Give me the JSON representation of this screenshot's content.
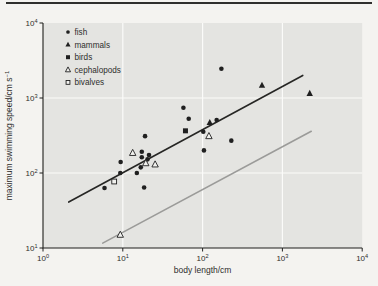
{
  "chart_data": {
    "type": "scatter",
    "title": "",
    "xlabel": "body length/cm",
    "ylabel": "maximum swimming speed/cm s",
    "ylabel_sup": "−1",
    "x_scale": "log",
    "y_scale": "log",
    "xlim": [
      1,
      10000
    ],
    "ylim": [
      10,
      10000
    ],
    "x_tick_exponents": [
      0,
      1,
      2,
      3,
      4
    ],
    "y_tick_exponents": [
      1,
      2,
      3,
      4
    ],
    "tick_base": "10",
    "grid": true,
    "legend_position": "top-left",
    "series": [
      {
        "name": "fish",
        "marker": "filled-circle",
        "points": [
          [
            5.9,
            63
          ],
          [
            9.4,
            140
          ],
          [
            9.3,
            100
          ],
          [
            15,
            100
          ],
          [
            16.8,
            119
          ],
          [
            18.5,
            64
          ],
          [
            17.3,
            192
          ],
          [
            17.3,
            162
          ],
          [
            19,
            310
          ],
          [
            20.4,
            152
          ],
          [
            21.3,
            174
          ],
          [
            57.5,
            740
          ],
          [
            67,
            530
          ],
          [
            102,
            355
          ],
          [
            104,
            200
          ],
          [
            150,
            510
          ],
          [
            172,
            2450
          ],
          [
            229,
            270
          ]
        ]
      },
      {
        "name": "mammals",
        "marker": "filled-triangle",
        "points": [
          [
            123,
            470
          ],
          [
            555,
            1480
          ],
          [
            2200,
            1150
          ]
        ]
      },
      {
        "name": "birds",
        "marker": "filled-square",
        "points": [
          [
            61,
            365
          ]
        ]
      },
      {
        "name": "cephalopods",
        "marker": "open-triangle",
        "points": [
          [
            13.3,
            185
          ],
          [
            19.4,
            135
          ],
          [
            25.4,
            130
          ],
          [
            120,
            310
          ],
          [
            9.3,
            15
          ]
        ]
      },
      {
        "name": "bivalves",
        "marker": "open-square",
        "points": [
          [
            7.8,
            77
          ]
        ]
      }
    ],
    "lines": [
      {
        "name": "upper-trend-line",
        "color": "#262624",
        "from": [
          2.1,
          41
        ],
        "to": [
          1800,
          2000
        ]
      },
      {
        "name": "lower-trend-line",
        "color": "#9b9b99",
        "from": [
          5.6,
          11.6
        ],
        "to": [
          2300,
          360
        ]
      }
    ],
    "colors": {
      "marker": "#202020",
      "open_marker_fill": "#f1f1ee",
      "plot_bg": "#e4e4e1",
      "grid": "#fbfbf9",
      "page_bg": "#f4f3f0",
      "axis": "#1f1f1d",
      "text": "#2e2e2c"
    }
  }
}
